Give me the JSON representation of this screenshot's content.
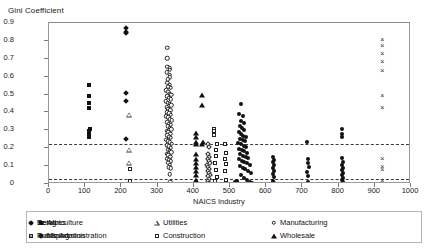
{
  "chart_data": {
    "type": "scatter",
    "title": "",
    "ylabel": "Gini Coefficient",
    "xlabel": "NAICS Industry",
    "xlim": [
      0,
      1000
    ],
    "ylim": [
      0,
      0.9
    ],
    "xticks": [
      0,
      100,
      200,
      300,
      400,
      500,
      600,
      700,
      800,
      900,
      1000
    ],
    "yticks": [
      "0",
      "0.1",
      "0.2",
      "0.3",
      "0.4",
      "0.5",
      "0.6",
      "0.7",
      "0.8",
      "0.9"
    ],
    "grid": false,
    "legend_position": "bottom",
    "reference_lines": [
      {
        "name": "upper-dashed-reference",
        "y": 0.225,
        "style": "dashed"
      },
      {
        "name": "lower-dashed-reference",
        "y": 0.03,
        "style": "dashed"
      }
    ],
    "series": [
      {
        "name": "Agriculture",
        "marker": "filled-square",
        "points": [
          [
            111,
            0.555
          ],
          [
            111,
            0.452
          ],
          [
            111,
            0.425
          ],
          [
            110,
            0.49
          ],
          [
            110,
            0.295
          ],
          [
            112,
            0.305
          ],
          [
            111,
            0.285
          ],
          [
            111,
            0.262
          ]
        ]
      },
      {
        "name": "Mining",
        "marker": "filled-diamond",
        "points": [
          [
            212,
            0.872
          ],
          [
            212,
            0.852
          ],
          [
            212,
            0.843
          ],
          [
            213,
            0.508
          ],
          [
            213,
            0.466
          ],
          [
            213,
            0.252
          ]
        ]
      },
      {
        "name": "Utilities",
        "marker": "open-triangle",
        "points": [
          [
            221,
            0.385
          ],
          [
            221,
            0.19
          ],
          [
            221,
            0.12
          ],
          [
            221,
            0.012
          ]
        ]
      },
      {
        "name": "Construction",
        "marker": "open-square",
        "points": [
          [
            224,
            0.082
          ],
          [
            224,
            0.018
          ],
          [
            455,
            0.31
          ],
          [
            457,
            0.295
          ],
          [
            456,
            0.275
          ],
          [
            463,
            0.225
          ],
          [
            462,
            0.19
          ],
          [
            460,
            0.155
          ],
          [
            459,
            0.12
          ],
          [
            461,
            0.078
          ],
          [
            463,
            0.038
          ],
          [
            458,
            0.015
          ]
        ]
      },
      {
        "name": "Manufacturing",
        "marker": "open-circle",
        "points": [
          [
            327,
            0.763
          ],
          [
            326,
            0.702
          ],
          [
            327,
            0.655
          ],
          [
            333,
            0.648
          ],
          [
            334,
            0.638
          ],
          [
            325,
            0.625
          ],
          [
            334,
            0.612
          ],
          [
            333,
            0.598
          ],
          [
            328,
            0.585
          ],
          [
            326,
            0.565
          ],
          [
            333,
            0.555
          ],
          [
            330,
            0.545
          ],
          [
            336,
            0.538
          ],
          [
            324,
            0.525
          ],
          [
            329,
            0.515
          ],
          [
            334,
            0.505
          ],
          [
            338,
            0.498
          ],
          [
            326,
            0.49
          ],
          [
            331,
            0.482
          ],
          [
            336,
            0.475
          ],
          [
            323,
            0.462
          ],
          [
            328,
            0.455
          ],
          [
            333,
            0.448
          ],
          [
            338,
            0.44
          ],
          [
            325,
            0.428
          ],
          [
            330,
            0.42
          ],
          [
            335,
            0.412
          ],
          [
            327,
            0.402
          ],
          [
            332,
            0.395
          ],
          [
            337,
            0.388
          ],
          [
            324,
            0.378
          ],
          [
            329,
            0.372
          ],
          [
            334,
            0.362
          ],
          [
            339,
            0.355
          ],
          [
            326,
            0.345
          ],
          [
            331,
            0.338
          ],
          [
            336,
            0.33
          ],
          [
            328,
            0.322
          ],
          [
            333,
            0.315
          ],
          [
            338,
            0.305
          ],
          [
            325,
            0.298
          ],
          [
            330,
            0.29
          ],
          [
            335,
            0.282
          ],
          [
            327,
            0.272
          ],
          [
            332,
            0.265
          ],
          [
            337,
            0.258
          ],
          [
            324,
            0.248
          ],
          [
            329,
            0.24
          ],
          [
            334,
            0.232
          ],
          [
            339,
            0.225
          ],
          [
            326,
            0.218
          ],
          [
            331,
            0.21
          ],
          [
            336,
            0.202
          ],
          [
            328,
            0.192
          ],
          [
            333,
            0.185
          ],
          [
            338,
            0.178
          ],
          [
            325,
            0.168
          ],
          [
            330,
            0.16
          ],
          [
            335,
            0.152
          ],
          [
            327,
            0.142
          ],
          [
            332,
            0.135
          ],
          [
            337,
            0.128
          ],
          [
            329,
            0.118
          ],
          [
            334,
            0.108
          ],
          [
            331,
            0.095
          ],
          [
            336,
            0.088
          ],
          [
            333,
            0.055
          ],
          [
            335,
            0.012
          ]
        ]
      },
      {
        "name": "Wholesale",
        "marker": "filled-triangle",
        "points": [
          [
            424,
            0.498
          ],
          [
            424,
            0.442
          ],
          [
            406,
            0.285
          ],
          [
            406,
            0.26
          ],
          [
            406,
            0.235
          ],
          [
            406,
            0.225
          ],
          [
            406,
            0.165
          ],
          [
            406,
            0.142
          ],
          [
            406,
            0.118
          ],
          [
            406,
            0.095
          ],
          [
            406,
            0.072
          ],
          [
            406,
            0.048
          ],
          [
            406,
            0.022
          ],
          [
            425,
            0.235
          ],
          [
            424,
            0.222
          ]
        ]
      },
      {
        "name": "Retail",
        "marker": "open-diamond",
        "points": [
          [
            438,
            0.225
          ],
          [
            442,
            0.205
          ],
          [
            440,
            0.168
          ],
          [
            443,
            0.152
          ],
          [
            438,
            0.138
          ],
          [
            441,
            0.128
          ],
          [
            444,
            0.118
          ],
          [
            437,
            0.105
          ],
          [
            440,
            0.095
          ],
          [
            443,
            0.085
          ],
          [
            438,
            0.072
          ],
          [
            441,
            0.062
          ],
          [
            444,
            0.052
          ],
          [
            439,
            0.042
          ],
          [
            442,
            0.03
          ],
          [
            440,
            0.018
          ],
          [
            443,
            0.008
          ],
          [
            437,
            0.002
          ]
        ]
      },
      {
        "name": "Transportation",
        "marker": "open-square",
        "points": [
          [
            486,
            0.225
          ],
          [
            488,
            0.172
          ],
          [
            487,
            0.142
          ],
          [
            489,
            0.112
          ],
          [
            486,
            0.075
          ],
          [
            488,
            0.02
          ]
        ]
      },
      {
        "name": "Services",
        "marker": "filled-circle",
        "points": [
          [
            531,
            0.45
          ],
          [
            525,
            0.392
          ],
          [
            536,
            0.378
          ],
          [
            530,
            0.352
          ],
          [
            538,
            0.342
          ],
          [
            527,
            0.322
          ],
          [
            533,
            0.312
          ],
          [
            540,
            0.302
          ],
          [
            524,
            0.29
          ],
          [
            530,
            0.282
          ],
          [
            537,
            0.27
          ],
          [
            543,
            0.262
          ],
          [
            528,
            0.252
          ],
          [
            535,
            0.245
          ],
          [
            541,
            0.238
          ],
          [
            523,
            0.228
          ],
          [
            531,
            0.222
          ],
          [
            538,
            0.212
          ],
          [
            545,
            0.205
          ],
          [
            526,
            0.198
          ],
          [
            533,
            0.19
          ],
          [
            540,
            0.182
          ],
          [
            548,
            0.175
          ],
          [
            529,
            0.168
          ],
          [
            536,
            0.158
          ],
          [
            543,
            0.152
          ],
          [
            551,
            0.145
          ],
          [
            524,
            0.138
          ],
          [
            532,
            0.13
          ],
          [
            539,
            0.122
          ],
          [
            546,
            0.115
          ],
          [
            554,
            0.108
          ],
          [
            527,
            0.098
          ],
          [
            535,
            0.09
          ],
          [
            542,
            0.082
          ],
          [
            550,
            0.075
          ],
          [
            558,
            0.062
          ],
          [
            530,
            0.048
          ],
          [
            538,
            0.035
          ],
          [
            546,
            0.022
          ],
          [
            554,
            0.012
          ],
          [
            562,
            0.008
          ],
          [
            520,
            0.015
          ],
          [
            515,
            0.01
          ],
          [
            620,
            0.152
          ],
          [
            621,
            0.135
          ],
          [
            620,
            0.122
          ],
          [
            622,
            0.108
          ],
          [
            620,
            0.09
          ],
          [
            621,
            0.072
          ],
          [
            620,
            0.055
          ],
          [
            622,
            0.038
          ],
          [
            620,
            0.018
          ],
          [
            621,
            0.005
          ],
          [
            714,
            0.232
          ],
          [
            716,
            0.142
          ],
          [
            715,
            0.118
          ],
          [
            717,
            0.095
          ],
          [
            714,
            0.068
          ],
          [
            716,
            0.042
          ],
          [
            715,
            0.012
          ],
          [
            810,
            0.305
          ],
          [
            810,
            0.282
          ],
          [
            810,
            0.262
          ],
          [
            810,
            0.148
          ],
          [
            811,
            0.122
          ],
          [
            810,
            0.108
          ],
          [
            811,
            0.092
          ],
          [
            810,
            0.078
          ],
          [
            811,
            0.062
          ],
          [
            810,
            0.048
          ],
          [
            811,
            0.035
          ],
          [
            810,
            0.022
          ],
          [
            811,
            0.01
          ],
          [
            810,
            0.002
          ]
        ]
      },
      {
        "name": "Public Administration",
        "marker": "cross-x",
        "points": [
          [
            921,
            0.808
          ],
          [
            921,
            0.775
          ],
          [
            921,
            0.735
          ],
          [
            921,
            0.688
          ],
          [
            921,
            0.635
          ],
          [
            921,
            0.495
          ],
          [
            921,
            0.432
          ],
          [
            921,
            0.148
          ],
          [
            921,
            0.098
          ],
          [
            921,
            0.082
          ],
          [
            921,
            0.022
          ],
          [
            921,
            0.008
          ]
        ]
      }
    ],
    "legend": [
      {
        "label": "Agriculture",
        "marker": "filled-square"
      },
      {
        "label": "Mining",
        "marker": "filled-diamond"
      },
      {
        "label": "Utilities",
        "marker": "open-triangle"
      },
      {
        "label": "Construction",
        "marker": "open-square"
      },
      {
        "label": "Manufacturing",
        "marker": "open-circle"
      },
      {
        "label": "Wholesale",
        "marker": "filled-triangle"
      },
      {
        "label": "Retail",
        "marker": "open-diamond"
      },
      {
        "label": "Transportation",
        "marker": "open-square"
      },
      {
        "label": "Services",
        "marker": "filled-circle"
      },
      {
        "label": "Public Administration",
        "marker": "cross-x"
      }
    ]
  }
}
